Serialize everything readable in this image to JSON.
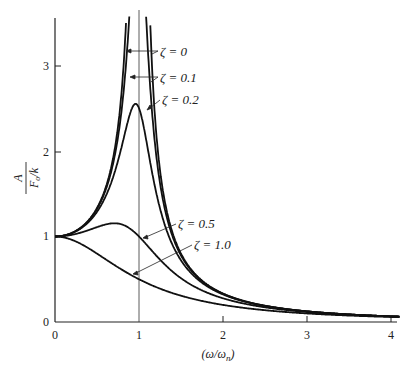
{
  "chart_data": {
    "type": "line",
    "title": "",
    "xlabel": "(ω/ω_n)",
    "ylabel": "A / (F_o/k)",
    "xlim": [
      0,
      4.1
    ],
    "ylim": [
      0,
      3.6
    ],
    "xticks": [
      0,
      1,
      2,
      3,
      4
    ],
    "yticks": [
      0,
      1,
      2,
      3
    ],
    "grid": false,
    "reference_line": {
      "x": 1
    },
    "formula": "A/(F_o/k) = 1/sqrt((1-r^2)^2 + (2*zeta*r)^2), r = ω/ω_n",
    "series": [
      {
        "name": "ζ = 0",
        "zeta": 0.0,
        "peak": "unbounded at r=1"
      },
      {
        "name": "ζ = 0.1",
        "zeta": 0.1,
        "peak": 5.03
      },
      {
        "name": "ζ = 0.2",
        "zeta": 0.2,
        "peak": 2.55
      },
      {
        "name": "ζ = 0.5",
        "zeta": 0.5,
        "peak": 1.15
      },
      {
        "name": "ζ = 1.0",
        "zeta": 1.0,
        "peak": 1.0
      }
    ],
    "sample_points": {
      "x": [
        0,
        0.5,
        1.0,
        1.5,
        2.0,
        3.0,
        4.0
      ],
      "zeta_0.5": [
        1.0,
        1.07,
        1.0,
        0.55,
        0.28,
        0.11,
        0.06
      ],
      "zeta_1.0": [
        1.0,
        0.8,
        0.5,
        0.31,
        0.2,
        0.1,
        0.06
      ],
      "zeta_0.2": [
        1.0,
        1.29,
        2.5,
        0.74,
        0.32,
        0.12,
        0.07
      ]
    },
    "annotations": [
      {
        "text": "ζ = 0",
        "series": "ζ = 0"
      },
      {
        "text": "ζ = 0.1",
        "series": "ζ = 0.1"
      },
      {
        "text": "ζ = 0.2",
        "series": "ζ = 0.2"
      },
      {
        "text": "ζ = 0.5",
        "series": "ζ = 0.5"
      },
      {
        "text": "ζ = 1.0",
        "series": "ζ = 1.0"
      }
    ]
  },
  "labels": {
    "xaxis": "(ω/ω",
    "xaxis_sub": "n",
    "yaxis_num": "A",
    "yaxis_den": "F",
    "yaxis_den_sub": "o",
    "yaxis_den_rest": "/k",
    "xtick_labels": [
      "0",
      "1",
      "2",
      "3",
      "4"
    ],
    "ytick_labels": [
      "0",
      "1",
      "2",
      "3"
    ],
    "ann": [
      "ζ = 0",
      "ζ = 0.1",
      "ζ = 0.2",
      "ζ = 0.5",
      "ζ = 1.0"
    ]
  }
}
